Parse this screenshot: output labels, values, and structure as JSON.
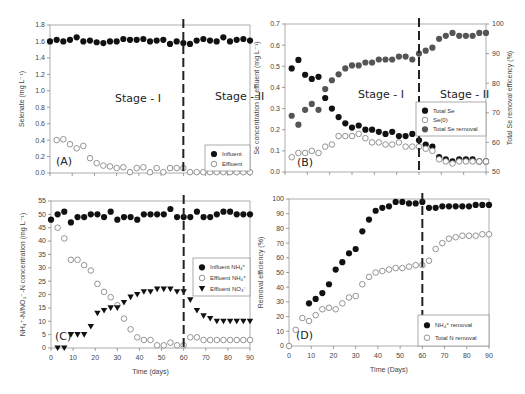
{
  "chart_data": [
    {
      "id": "A",
      "type": "scatter",
      "panel_label": "(A)",
      "xlabel": "",
      "ylabel": "Selenate (mg L⁻¹)",
      "xlim": [
        0,
        90
      ],
      "ylim": [
        0,
        1.8
      ],
      "yticks": [
        "0.0",
        "0.2",
        "0.4",
        "0.6",
        "0.8",
        "1.0",
        "1.2",
        "1.4",
        "1.6",
        "1.8"
      ],
      "xticks_labeled": false,
      "stage_divider_x": 60,
      "annotations": [
        "Stage - I",
        "Stage - II"
      ],
      "legend": {
        "placement": "bottom-right",
        "entries": [
          "Influent",
          "Effluent"
        ]
      },
      "series": [
        {
          "name": "Influent",
          "marker": "filled-circle",
          "color": "#111111",
          "x": [
            0,
            3,
            6,
            9,
            12,
            15,
            18,
            21,
            24,
            27,
            30,
            33,
            36,
            39,
            42,
            45,
            48,
            51,
            54,
            57,
            60,
            63,
            66,
            69,
            72,
            75,
            78,
            81,
            84,
            87,
            90
          ],
          "y": [
            1.6,
            1.62,
            1.6,
            1.62,
            1.65,
            1.6,
            1.61,
            1.59,
            1.58,
            1.6,
            1.6,
            1.63,
            1.62,
            1.62,
            1.63,
            1.6,
            1.61,
            1.62,
            1.57,
            1.6,
            1.58,
            1.57,
            1.61,
            1.63,
            1.61,
            1.6,
            1.65,
            1.6,
            1.62,
            1.63,
            1.61
          ]
        },
        {
          "name": "Effluent",
          "marker": "open-circle",
          "color": "#888888",
          "x": [
            3,
            6,
            9,
            12,
            15,
            18,
            21,
            24,
            27,
            30,
            33,
            36,
            39,
            42,
            45,
            48,
            51,
            54,
            57,
            60,
            63,
            66,
            69,
            72,
            75,
            78,
            81,
            84,
            87,
            90
          ],
          "y": [
            0.4,
            0.41,
            0.35,
            0.3,
            0.33,
            0.18,
            0.12,
            0.09,
            0.08,
            0.06,
            0.07,
            0.01,
            0.06,
            0.07,
            0.01,
            0.06,
            0.01,
            0.06,
            0.06,
            0.06,
            0.01,
            0.01,
            0.01,
            0.01,
            0.01,
            0.01,
            0.01,
            0.01,
            0.01,
            0.01
          ]
        }
      ]
    },
    {
      "id": "B",
      "type": "scatter",
      "panel_label": "(B)",
      "xlabel": "",
      "ylabel": "Se concentration in effluent (mg L⁻¹)",
      "y2label": "Total Se removal efficency (%)",
      "xlim": [
        0,
        90
      ],
      "ylim": [
        0,
        0.7
      ],
      "y2lim": [
        50,
        100
      ],
      "yticks": [
        "0.0",
        "0.1",
        "0.2",
        "0.3",
        "0.4",
        "0.5",
        "0.6",
        "0.7"
      ],
      "y2ticks": [
        "50",
        "60",
        "70",
        "80",
        "90",
        "100"
      ],
      "xticks_labeled": false,
      "stage_divider_x": 60,
      "annotations": [
        "Stage - I",
        "Stage - II"
      ],
      "legend": {
        "placement": "center-right",
        "entries": [
          "Total Se",
          "Se(0)",
          "Total Se removal"
        ]
      },
      "series": [
        {
          "name": "Total Se",
          "axis": "left",
          "marker": "filled-circle",
          "color": "#111111",
          "x": [
            3,
            6,
            9,
            12,
            15,
            18,
            21,
            24,
            27,
            30,
            33,
            36,
            39,
            42,
            45,
            48,
            51,
            54,
            57,
            60,
            63,
            66,
            69,
            72,
            75,
            78,
            81,
            84,
            87,
            90
          ],
          "y": [
            0.49,
            0.53,
            0.46,
            0.44,
            0.45,
            0.35,
            0.3,
            0.26,
            0.23,
            0.21,
            0.22,
            0.2,
            0.2,
            0.19,
            0.18,
            0.19,
            0.17,
            0.17,
            0.18,
            0.15,
            0.13,
            0.12,
            0.07,
            0.06,
            0.05,
            0.06,
            0.06,
            0.06,
            0.05,
            0.05
          ]
        },
        {
          "name": "Se(0)",
          "axis": "left",
          "marker": "open-circle",
          "color": "#888888",
          "x": [
            3,
            6,
            9,
            12,
            15,
            18,
            21,
            24,
            27,
            30,
            33,
            36,
            39,
            42,
            45,
            48,
            51,
            54,
            57,
            60,
            63,
            66,
            69,
            72,
            75,
            78,
            81,
            84,
            87,
            90
          ],
          "y": [
            0.07,
            0.09,
            0.09,
            0.1,
            0.09,
            0.12,
            0.13,
            0.17,
            0.17,
            0.17,
            0.18,
            0.16,
            0.14,
            0.14,
            0.13,
            0.13,
            0.14,
            0.12,
            0.12,
            0.12,
            0.11,
            0.1,
            0.06,
            0.05,
            0.04,
            0.05,
            0.05,
            0.05,
            0.05,
            0.05
          ]
        },
        {
          "name": "Total Se removal",
          "axis": "right",
          "marker": "filled-circle",
          "color": "#555555",
          "x": [
            3,
            6,
            9,
            12,
            15,
            18,
            21,
            24,
            27,
            30,
            33,
            36,
            39,
            42,
            45,
            48,
            51,
            54,
            57,
            60,
            63,
            66,
            69,
            72,
            75,
            78,
            81,
            84,
            87,
            90
          ],
          "y": [
            69,
            66,
            71,
            73,
            71,
            78,
            81,
            83,
            85,
            86,
            86,
            87,
            87,
            88,
            88,
            88,
            89,
            89,
            88,
            90,
            91,
            92,
            95,
            96,
            97,
            96,
            96,
            96,
            97,
            97
          ]
        }
      ]
    },
    {
      "id": "C",
      "type": "scatter",
      "panel_label": "(C)",
      "xlabel": "Time (days)",
      "ylabel": "NH₄⁺-N/NO₃⁻-N concentration (mg L⁻¹)",
      "xlim": [
        0,
        90
      ],
      "ylim": [
        0,
        55
      ],
      "xticks": [
        "0",
        "10",
        "20",
        "30",
        "40",
        "50",
        "60",
        "70",
        "80",
        "90"
      ],
      "yticks": [
        "0",
        "5",
        "10",
        "15",
        "20",
        "25",
        "30",
        "35",
        "40",
        "45",
        "50",
        "55"
      ],
      "stage_divider_x": 60,
      "legend": {
        "placement": "center-right",
        "entries": [
          "Influent NH₄⁺",
          "Effluent NH₄⁺",
          "Effluent NO₃⁻"
        ]
      },
      "series": [
        {
          "name": "Influent NH₄⁺",
          "marker": "filled-circle",
          "color": "#111111",
          "x": [
            0,
            3,
            6,
            9,
            12,
            15,
            18,
            21,
            24,
            27,
            30,
            33,
            36,
            39,
            42,
            45,
            48,
            51,
            54,
            57,
            60,
            63,
            66,
            69,
            72,
            75,
            78,
            81,
            84,
            87,
            90
          ],
          "y": [
            48,
            50,
            51,
            47,
            49,
            49,
            50,
            50,
            49,
            51,
            48,
            49,
            49,
            48,
            50,
            50,
            50,
            50,
            52,
            49,
            49,
            49,
            51,
            49,
            49,
            50,
            51,
            51,
            50,
            50,
            50
          ]
        },
        {
          "name": "Effluent NH₄⁺",
          "marker": "open-circle",
          "color": "#888888",
          "x": [
            3,
            6,
            9,
            12,
            15,
            18,
            21,
            24,
            27,
            30,
            33,
            36,
            39,
            42,
            45,
            48,
            51,
            54,
            57,
            60,
            63,
            66,
            69,
            72,
            75,
            78,
            81,
            84,
            87,
            90
          ],
          "y": [
            45,
            41,
            33,
            33,
            31,
            29,
            24,
            21,
            19,
            16,
            11,
            7,
            4,
            3,
            3,
            1,
            1,
            2,
            1,
            1,
            4,
            4,
            3,
            3,
            3,
            3,
            3,
            3,
            3,
            3
          ]
        },
        {
          "name": "Effluent NO₃⁻",
          "marker": "filled-triangle-down",
          "color": "#111111",
          "x": [
            3,
            6,
            9,
            12,
            15,
            18,
            21,
            24,
            27,
            30,
            33,
            36,
            39,
            42,
            45,
            48,
            51,
            54,
            57,
            60,
            63,
            66,
            69,
            72,
            75,
            78,
            81,
            84,
            87,
            90
          ],
          "y": [
            0,
            0,
            5,
            5,
            5,
            8,
            13,
            14,
            15,
            15,
            17,
            19,
            20,
            21,
            21,
            22,
            22,
            22,
            21,
            21,
            18,
            14,
            12,
            11,
            10,
            10,
            10,
            10,
            10,
            10
          ]
        }
      ]
    },
    {
      "id": "D",
      "type": "scatter",
      "panel_label": "(D)",
      "xlabel": "Time (Days)",
      "ylabel": "Removal efficiency (%)",
      "xlim": [
        0,
        90
      ],
      "ylim": [
        0,
        100
      ],
      "xticks": [
        "0",
        "10",
        "20",
        "30",
        "40",
        "50",
        "60",
        "70",
        "80",
        "90"
      ],
      "yticks": [
        "0",
        "10",
        "20",
        "30",
        "40",
        "50",
        "60",
        "70",
        "80",
        "90",
        "100"
      ],
      "stage_divider_x": 60,
      "legend": {
        "placement": "bottom-right",
        "entries": [
          "NH₄⁺ removal",
          "Total N removal"
        ]
      },
      "series": [
        {
          "name": "NH₄⁺ removal",
          "marker": "filled-circle",
          "color": "#111111",
          "x": [
            9,
            12,
            15,
            18,
            21,
            24,
            27,
            30,
            33,
            36,
            39,
            42,
            45,
            48,
            51,
            54,
            57,
            60,
            63,
            66,
            69,
            72,
            75,
            78,
            81,
            84,
            87,
            90
          ],
          "y": [
            29,
            32,
            36,
            42,
            52,
            57,
            63,
            66,
            78,
            86,
            92,
            94,
            95,
            98,
            98,
            97,
            97,
            98,
            94,
            94,
            95,
            95,
            95,
            95,
            95,
            96,
            96,
            96
          ]
        },
        {
          "name": "Total N removal",
          "marker": "open-circle",
          "color": "#888888",
          "x": [
            0,
            3,
            6,
            9,
            12,
            15,
            18,
            21,
            24,
            27,
            30,
            33,
            36,
            39,
            42,
            45,
            48,
            51,
            54,
            57,
            60,
            63,
            66,
            69,
            72,
            75,
            78,
            81,
            84,
            87,
            90
          ],
          "y": [
            0,
            11,
            19,
            17,
            21,
            25,
            26,
            25,
            29,
            33,
            34,
            42,
            47,
            50,
            51,
            52,
            53,
            53,
            54,
            55,
            55,
            58,
            66,
            70,
            73,
            74,
            75,
            75,
            75,
            76,
            76
          ]
        }
      ]
    }
  ],
  "layout_text": {
    "stage1": "Stage - I",
    "stage2": "Stage - II"
  }
}
